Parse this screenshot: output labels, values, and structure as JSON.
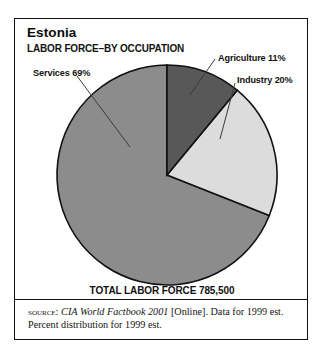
{
  "figure": {
    "title": "Estonia",
    "subtitle": "LABOR FORCE–BY OCCUPATION",
    "total_label": "TOTAL LABOR FORCE 785,500",
    "source": {
      "kicker": "SOURCE:",
      "title": "CIA World Factbook 2001",
      "rest": "[Online]. Data for 1999 est.",
      "line2": "Percent distribution for 1999 est."
    }
  },
  "labels": {
    "services": "Services 69%",
    "agriculture": "Agriculture 11%",
    "industry": "Industry 20%"
  },
  "chart_data": {
    "type": "pie",
    "subtitle": "TOTAL LABOR FORCE 785,500",
    "total": 785500,
    "total_text": "785,500",
    "unit": "percent",
    "start_angle_deg": 0,
    "direction": "clockwise",
    "legend_position": "callout-labels",
    "grid": false,
    "categories": [
      "Agriculture",
      "Industry",
      "Services"
    ],
    "values": [
      11,
      20,
      69
    ],
    "labels": [
      "Agriculture 11%",
      "Industry 20%",
      "Services 69%"
    ],
    "colors": [
      "#585858",
      "#dcdcdc",
      "#8c8c8c"
    ],
    "slices": [
      {
        "name": "Agriculture",
        "value": 11,
        "label": "Agriculture 11%",
        "color": "#585858",
        "start_deg": 0,
        "end_deg": 39.6
      },
      {
        "name": "Industry",
        "value": 20,
        "label": "Industry 20%",
        "color": "#dcdcdc",
        "start_deg": 39.6,
        "end_deg": 111.6
      },
      {
        "name": "Services",
        "value": 69,
        "label": "Services 69%",
        "color": "#8c8c8c",
        "start_deg": 111.6,
        "end_deg": 360
      }
    ],
    "annotations": [
      "TOTAL LABOR FORCE 785,500",
      "SOURCE: CIA World Factbook 2001 [Online]. Data for 1999 est.",
      "Percent distribution for 1999 est."
    ]
  }
}
